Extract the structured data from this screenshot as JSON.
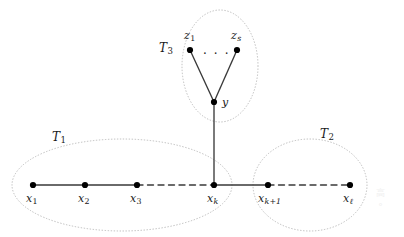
{
  "figure": {
    "type": "graph-diagram",
    "width": 404,
    "height": 237,
    "background": "#ffffff",
    "stroke_color": "#3a3a3a",
    "node_color": "#000000",
    "group_outline_color": "#b5b5b5"
  },
  "vertices": [
    {
      "id": "x1",
      "label": "x",
      "sub": "1",
      "sub_style": "normal",
      "cx": 33,
      "cy": 185,
      "label_x": 26,
      "label_y": 193
    },
    {
      "id": "x2",
      "label": "x",
      "sub": "2",
      "sub_style": "normal",
      "cx": 85,
      "cy": 185,
      "label_x": 78,
      "label_y": 193
    },
    {
      "id": "x3",
      "label": "x",
      "sub": "3",
      "sub_style": "normal",
      "cx": 137,
      "cy": 185,
      "label_x": 130,
      "label_y": 193
    },
    {
      "id": "xk",
      "label": "x",
      "sub": "k",
      "sub_style": "italic",
      "cx": 214,
      "cy": 185,
      "label_x": 207,
      "label_y": 193
    },
    {
      "id": "xk1",
      "label": "x",
      "sub": "k+1",
      "sub_style": "italic",
      "cx": 268,
      "cy": 185,
      "label_x": 258,
      "label_y": 193
    },
    {
      "id": "xl",
      "label": "x",
      "sub": "ℓ",
      "sub_style": "italic",
      "cx": 350,
      "cy": 185,
      "label_x": 343,
      "label_y": 193
    },
    {
      "id": "y",
      "label": "y",
      "sub": "",
      "sub_style": "normal",
      "cx": 214,
      "cy": 102,
      "label_x": 222,
      "label_y": 97
    },
    {
      "id": "z1",
      "label": "z",
      "sub": "1",
      "sub_style": "normal",
      "cx": 190,
      "cy": 50,
      "label_x": 184,
      "label_y": 30
    },
    {
      "id": "zs",
      "label": "z",
      "sub": "s",
      "sub_style": "italic",
      "cx": 237,
      "cy": 50,
      "label_x": 231,
      "label_y": 30
    }
  ],
  "edges": [
    {
      "from": "x1",
      "to": "x2",
      "style": "solid"
    },
    {
      "from": "x2",
      "to": "x3",
      "style": "solid"
    },
    {
      "from": "x3",
      "to": "xk",
      "style": "dashed"
    },
    {
      "from": "xk",
      "to": "xk1",
      "style": "solid"
    },
    {
      "from": "xk1",
      "to": "xl",
      "style": "dashed"
    },
    {
      "from": "xk",
      "to": "y",
      "style": "solid"
    },
    {
      "from": "y",
      "to": "z1",
      "style": "solid"
    },
    {
      "from": "y",
      "to": "zs",
      "style": "solid"
    }
  ],
  "ellipsis": {
    "text": "· · ·",
    "x": 203,
    "y": 48
  },
  "groups": [
    {
      "id": "T1",
      "label": "T",
      "sub": "1",
      "cx": 122,
      "cy": 185,
      "rx": 110,
      "ry": 46,
      "label_x": 52,
      "label_y": 131
    },
    {
      "id": "T2",
      "label": "T",
      "sub": "2",
      "cx": 310,
      "cy": 185,
      "rx": 57,
      "ry": 46,
      "label_x": 320,
      "label_y": 128
    },
    {
      "id": "T3",
      "label": "T",
      "sub": "3",
      "cx": 220,
      "cy": 66,
      "rx": 38,
      "ry": 56,
      "label_x": 159,
      "label_y": 42
    }
  ],
  "watermark": {
    "line1": "高",
    "line2": "°"
  }
}
